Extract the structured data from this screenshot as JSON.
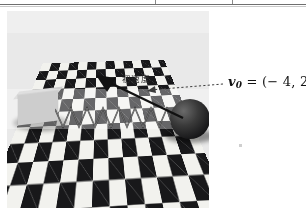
{
  "figure": {
    "kind": "physics-diagram-photo",
    "caption_jp": "初速度",
    "formula_plain": "v0 = (-4, 2, 0)",
    "formula_parts": {
      "vector_symbol": "v",
      "subscript": "0",
      "equals": "=",
      "open": "(",
      "x": "− 4",
      "comma1": ",",
      "y": "2",
      "comma2": ",",
      "z": "0",
      "close": ")"
    },
    "objects": {
      "block_label": "gray-block",
      "spring_label": "coil-spring",
      "sphere_label": "dark-sphere",
      "floor_label": "checkerboard-floor"
    },
    "colors": {
      "checker_dark": "#18181a",
      "checker_light": "#f2f2ee",
      "block": "#b4b4b4",
      "sphere": "#141416",
      "arrow": "#141414",
      "leader": "#4a4a4a",
      "page_bg": "#ffffff",
      "photo_bg": "#e9e9e9",
      "rule": "#6f6f6f"
    }
  },
  "ruler": {
    "tick_positions_px": [
      155,
      232
    ],
    "line_y_px": 4
  }
}
